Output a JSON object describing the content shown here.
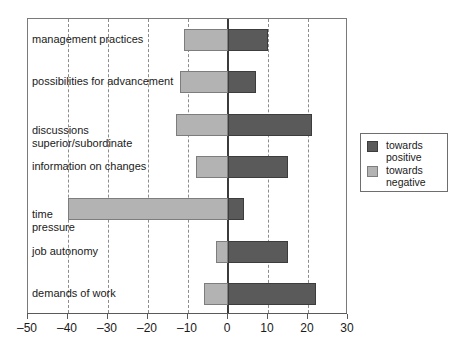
{
  "chart_data": {
    "type": "bar",
    "orientation": "horizontal",
    "title": "",
    "xlabel": "",
    "ylabel": "",
    "xlim": [
      -50,
      30
    ],
    "xticks": [
      -50,
      -40,
      -30,
      -20,
      -10,
      0,
      10,
      20,
      30
    ],
    "xtick_labels": [
      "–50",
      "–40",
      "–30",
      "–20",
      "–10",
      "0",
      "10",
      "20",
      "30"
    ],
    "grid": "vertical-dashed",
    "zero_line": true,
    "legend_position": "right-outside",
    "categories": [
      "management practices",
      "possibilities for advancement",
      "discussions\nsuperior/subordinate",
      "information on changes",
      "time\npressure",
      "job autonomy",
      "demands of work"
    ],
    "series": [
      {
        "name": "towards positive",
        "color": "#5a5a5a",
        "values": [
          10,
          7,
          21,
          15,
          4,
          15,
          22
        ]
      },
      {
        "name": "towards negative",
        "color": "#b3b3b3",
        "values": [
          -11,
          -12,
          -13,
          -8,
          -40,
          -3,
          -6
        ]
      }
    ]
  },
  "legend": {
    "items": [
      {
        "label": "towards\npositive",
        "swatch": "positive-swatch"
      },
      {
        "label": "towards\nnegative",
        "swatch": "negative-swatch"
      }
    ]
  },
  "colors": {
    "positive": "#5a5a5a",
    "negative": "#b3b3b3",
    "frame": "#7a7a7a",
    "grid": "#8c8c8c",
    "zero": "#3b3b3b",
    "text": "#1a1a1a",
    "background": "#ffffff"
  }
}
